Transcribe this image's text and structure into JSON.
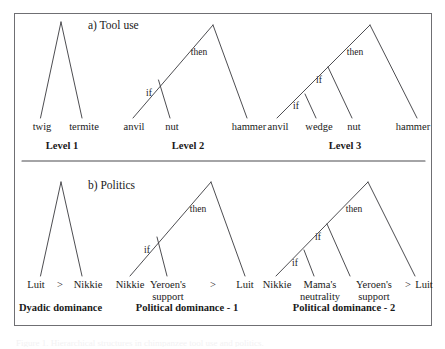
{
  "figure": {
    "panel_border_color": "#6f6f73",
    "line_color": "#39393d",
    "caption_fragment": "Figure 1. Hierarchical structures in chimpanzee tool use and politics."
  },
  "sections": [
    {
      "id": "tool-use",
      "title": "a) Tool use",
      "trees": [
        {
          "id": "level-1",
          "label": "Level 1",
          "connectives": [],
          "relations": [],
          "leaves": [
            {
              "text": "twig"
            },
            {
              "text": "termite"
            }
          ]
        },
        {
          "id": "level-2",
          "label": "Level 2",
          "connectives": [
            {
              "text": "then"
            },
            {
              "text": "if"
            }
          ],
          "relations": [],
          "leaves": [
            {
              "text": "anvil"
            },
            {
              "text": "nut"
            },
            {
              "text": "hammer"
            }
          ]
        },
        {
          "id": "level-3",
          "label": "Level 3",
          "connectives": [
            {
              "text": "then"
            },
            {
              "text": "if"
            },
            {
              "text": "if"
            }
          ],
          "relations": [],
          "leaves": [
            {
              "text": "anvil"
            },
            {
              "text": "wedge"
            },
            {
              "text": "nut"
            },
            {
              "text": "hammer"
            }
          ]
        }
      ]
    },
    {
      "id": "politics",
      "title": "b) Politics",
      "trees": [
        {
          "id": "dyadic-dominance",
          "label": "Dyadic dominance",
          "connectives": [],
          "relations": [
            {
              "text": ">"
            }
          ],
          "leaves": [
            {
              "text": "Luit"
            },
            {
              "text": "Nikkie"
            }
          ]
        },
        {
          "id": "political-dominance-1",
          "label": "Political dominance - 1",
          "connectives": [
            {
              "text": "then"
            },
            {
              "text": "if"
            }
          ],
          "relations": [
            {
              "text": ">"
            }
          ],
          "leaves": [
            {
              "text": "Nikkie"
            },
            {
              "text": "Yeroen's support"
            },
            {
              "text": "Luit"
            }
          ]
        },
        {
          "id": "political-dominance-2",
          "label": "Political dominance - 2",
          "connectives": [
            {
              "text": "then"
            },
            {
              "text": "if"
            },
            {
              "text": "if"
            }
          ],
          "relations": [
            {
              "text": ">"
            }
          ],
          "leaves": [
            {
              "text": "Nikkie"
            },
            {
              "text": "Mama's neutrality"
            },
            {
              "text": "Yeroen's support"
            },
            {
              "text": "Luit"
            }
          ]
        }
      ]
    }
  ]
}
